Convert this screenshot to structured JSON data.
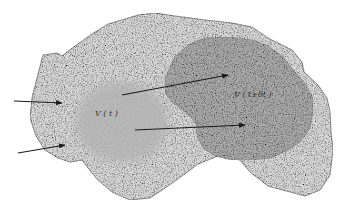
{
  "diagram": {
    "title": "",
    "labels": {
      "volume_t": "V ( t )",
      "volume_t_dt": "V ( t+δt )"
    },
    "colors": {
      "background": "#ffffff",
      "outer_region": "#d6d6d6",
      "volume_t": "#b8b8b8",
      "volume_t_dt": "#a9a9a9",
      "outline": "#7a7a7a",
      "arrows": "#1a1a1a"
    },
    "elements": [
      {
        "id": "outer-region",
        "type": "irregular-blob",
        "description": "speckled light-gray outer region"
      },
      {
        "id": "volume-t",
        "type": "fuzzy-blob",
        "label": "V ( t )"
      },
      {
        "id": "volume-t-dt",
        "type": "irregular-blob",
        "label": "V ( t+δt )"
      },
      {
        "id": "arrow-inflow-1",
        "type": "arrow",
        "from": [
          14,
          101
        ],
        "to": [
          62,
          103
        ]
      },
      {
        "id": "arrow-inflow-2",
        "type": "arrow",
        "from": [
          18,
          153
        ],
        "to": [
          65,
          145
        ]
      },
      {
        "id": "arrow-displacement-1",
        "type": "arrow",
        "from": [
          122,
          95
        ],
        "to": [
          228,
          75
        ]
      },
      {
        "id": "arrow-displacement-2",
        "type": "arrow",
        "from": [
          135,
          130
        ],
        "to": [
          245,
          125
        ]
      }
    ]
  }
}
